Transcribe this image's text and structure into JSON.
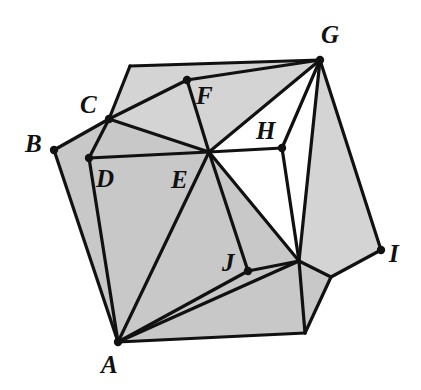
{
  "figure": {
    "background_color": "#ffffff",
    "fill_color": "#c8c8c8",
    "fill_color_light": "#d4d4d4",
    "stroke_color": "#111111",
    "stroke_width": 3.2,
    "dot_radius": 4.2,
    "label_color": "#111111"
  },
  "vertices": [
    {
      "id": "A",
      "label": "A",
      "x": 118,
      "y": 342,
      "labeled": true,
      "dot": true,
      "label_x": 101,
      "label_y": 373
    },
    {
      "id": "B",
      "label": "B",
      "x": 54,
      "y": 150,
      "labeled": true,
      "dot": true,
      "label_x": 25,
      "label_y": 152
    },
    {
      "id": "C",
      "label": "C",
      "x": 109,
      "y": 119,
      "labeled": true,
      "dot": true,
      "label_x": 80,
      "label_y": 113
    },
    {
      "id": "D",
      "label": "D",
      "x": 89,
      "y": 158,
      "labeled": true,
      "dot": true,
      "label_x": 96,
      "label_y": 187
    },
    {
      "id": "E",
      "label": "E",
      "x": 209,
      "y": 152,
      "labeled": true,
      "dot": false,
      "label_x": 171,
      "label_y": 188
    },
    {
      "id": "F",
      "label": "F",
      "x": 187,
      "y": 80,
      "labeled": true,
      "dot": true,
      "label_x": 196,
      "label_y": 104
    },
    {
      "id": "G",
      "label": "G",
      "x": 320,
      "y": 60,
      "labeled": true,
      "dot": true,
      "label_x": 321,
      "label_y": 43
    },
    {
      "id": "H",
      "label": "H",
      "x": 282,
      "y": 148,
      "labeled": true,
      "dot": true,
      "label_x": 256,
      "label_y": 139
    },
    {
      "id": "I",
      "label": "I",
      "x": 381,
      "y": 250,
      "labeled": true,
      "dot": true,
      "label_x": 389,
      "label_y": 262
    },
    {
      "id": "J",
      "label": "J",
      "x": 248,
      "y": 271,
      "labeled": true,
      "dot": true,
      "label_x": 222,
      "label_y": 271
    },
    {
      "id": "T",
      "label": "",
      "x": 130,
      "y": 66,
      "labeled": false,
      "dot": false,
      "label_x": 0,
      "label_y": 0
    },
    {
      "id": "K",
      "label": "",
      "x": 299,
      "y": 261,
      "labeled": false,
      "dot": false,
      "label_x": 0,
      "label_y": 0
    },
    {
      "id": "L",
      "label": "",
      "x": 331,
      "y": 277,
      "labeled": false,
      "dot": false,
      "label_x": 0,
      "label_y": 0
    },
    {
      "id": "M",
      "label": "",
      "x": 305,
      "y": 333,
      "labeled": false,
      "dot": false,
      "label_x": 0,
      "label_y": 0
    }
  ],
  "faces": [
    {
      "name": "face-upper-left",
      "points": "130,66 320,60 209,152 109,119",
      "shade": "light"
    },
    {
      "name": "face-square-abcd",
      "points": "118,342 54,150 109,119 209,152",
      "shade": "base"
    },
    {
      "name": "face-right-wing",
      "points": "320,60 381,250 331,277 299,261",
      "shade": "light"
    },
    {
      "name": "face-lower-right",
      "points": "209,152 299,261 305,333 118,342",
      "shade": "base"
    },
    {
      "name": "face-i-notch",
      "points": "299,261 331,277 305,333",
      "shade": "base"
    }
  ],
  "edges": [
    {
      "name": "edge-T-G",
      "from": "T",
      "to": "G"
    },
    {
      "name": "edge-T-C",
      "from": "T",
      "to": "C"
    },
    {
      "name": "edge-C-B",
      "from": "C",
      "to": "B"
    },
    {
      "name": "edge-B-A",
      "from": "B",
      "to": "A"
    },
    {
      "name": "edge-C-D",
      "from": "C",
      "to": "D"
    },
    {
      "name": "edge-D-A",
      "from": "D",
      "to": "A"
    },
    {
      "name": "edge-D-E",
      "from": "D",
      "to": "E"
    },
    {
      "name": "edge-C-E",
      "from": "C",
      "to": "E"
    },
    {
      "name": "edge-C-F",
      "from": "C",
      "to": "F"
    },
    {
      "name": "edge-F-E",
      "from": "F",
      "to": "E"
    },
    {
      "name": "edge-F-G",
      "from": "F",
      "to": "G"
    },
    {
      "name": "edge-E-G",
      "from": "E",
      "to": "G"
    },
    {
      "name": "edge-E-H",
      "from": "E",
      "to": "H"
    },
    {
      "name": "edge-H-G",
      "from": "H",
      "to": "G"
    },
    {
      "name": "edge-H-K",
      "from": "H",
      "to": "K"
    },
    {
      "name": "edge-E-K",
      "from": "E",
      "to": "K"
    },
    {
      "name": "edge-E-J",
      "from": "E",
      "to": "J"
    },
    {
      "name": "edge-E-A",
      "from": "E",
      "to": "A"
    },
    {
      "name": "edge-A-J",
      "from": "A",
      "to": "J"
    },
    {
      "name": "edge-J-K",
      "from": "J",
      "to": "K"
    },
    {
      "name": "edge-A-K",
      "from": "A",
      "to": "K"
    },
    {
      "name": "edge-A-M",
      "from": "A",
      "to": "M"
    },
    {
      "name": "edge-K-M",
      "from": "K",
      "to": "M"
    },
    {
      "name": "edge-G-K",
      "from": "G",
      "to": "K"
    },
    {
      "name": "edge-G-I",
      "from": "G",
      "to": "I"
    },
    {
      "name": "edge-K-L",
      "from": "K",
      "to": "L"
    },
    {
      "name": "edge-L-I",
      "from": "L",
      "to": "I"
    },
    {
      "name": "edge-L-M",
      "from": "L",
      "to": "M"
    }
  ]
}
